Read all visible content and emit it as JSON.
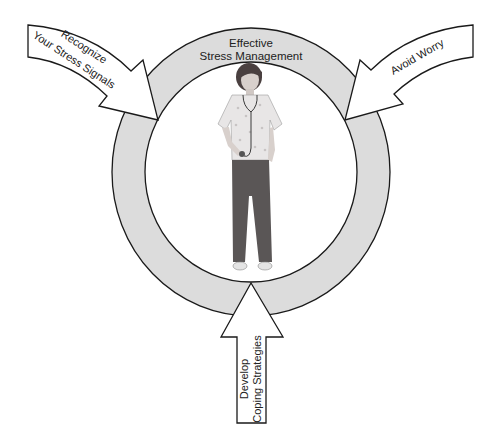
{
  "diagram": {
    "center_label": {
      "line1": "Effective",
      "line2": "Stress Management"
    },
    "arrows": [
      {
        "id": "recognize",
        "line1": "Recognize",
        "line2": "Your Stress Signals",
        "position": "upper-left"
      },
      {
        "id": "avoid",
        "line1": "Avoid Worry",
        "position": "upper-right"
      },
      {
        "id": "develop",
        "line1": "Develop",
        "line2": "Coping Strategies",
        "position": "bottom"
      }
    ],
    "figure": "nurse-with-stethoscope",
    "colors": {
      "ring_fill": "#dcdcdc",
      "stroke": "#1a1a1a",
      "arrow_fill": "#ffffff",
      "background": "#ffffff"
    }
  }
}
